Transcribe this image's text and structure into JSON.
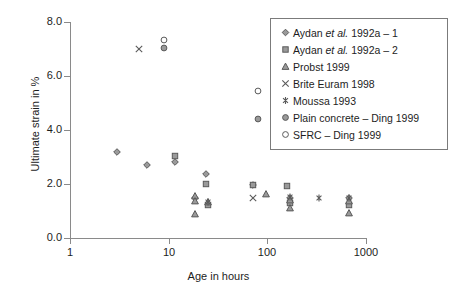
{
  "chart_data": {
    "type": "scatter",
    "title": "",
    "xlabel": "Age in hours",
    "ylabel": "Ultimate strain in %",
    "xscale": "log",
    "xlim": [
      1,
      1000
    ],
    "ylim": [
      0.0,
      8.0
    ],
    "xticks": [
      "1",
      "10",
      "100",
      "1000"
    ],
    "xtick_values": [
      1,
      10,
      100,
      1000
    ],
    "yticks": [
      "0.0",
      "2.0",
      "4.0",
      "6.0",
      "8.0"
    ],
    "ytick_values": [
      0.0,
      2.0,
      4.0,
      6.0,
      8.0
    ],
    "grid": false,
    "legend_position": "top-right",
    "series": [
      {
        "name": "Aydan et al. 1992a – 1",
        "name_pre": "Aydan ",
        "name_italic": "et al.",
        "name_post": " 1992a – 1",
        "marker": "diamond",
        "points": [
          {
            "x": 3.0,
            "y": 3.18
          },
          {
            "x": 6.0,
            "y": 2.72
          },
          {
            "x": 11.5,
            "y": 2.8
          },
          {
            "x": 24.0,
            "y": 2.36
          },
          {
            "x": 18.5,
            "y": 1.47
          },
          {
            "x": 72.0,
            "y": 1.95
          },
          {
            "x": 168.0,
            "y": 1.5
          },
          {
            "x": 672.0,
            "y": 1.5
          }
        ]
      },
      {
        "name": "Aydan et al. 1992a – 2",
        "name_pre": "Aydan ",
        "name_italic": "et al.",
        "name_post": " 1992a – 2",
        "marker": "square",
        "points": [
          {
            "x": 11.5,
            "y": 3.03
          },
          {
            "x": 24.0,
            "y": 2.0
          },
          {
            "x": 25.0,
            "y": 1.22
          },
          {
            "x": 72.0,
            "y": 1.98
          },
          {
            "x": 160.0,
            "y": 1.93
          },
          {
            "x": 168.0,
            "y": 1.28
          },
          {
            "x": 672.0,
            "y": 1.22
          }
        ]
      },
      {
        "name": "Probst 1999",
        "marker": "triangle",
        "points": [
          {
            "x": 18.5,
            "y": 1.57
          },
          {
            "x": 18.5,
            "y": 1.36
          },
          {
            "x": 18.5,
            "y": 0.9
          },
          {
            "x": 25.0,
            "y": 1.33
          },
          {
            "x": 96.0,
            "y": 1.62
          },
          {
            "x": 168.0,
            "y": 1.42
          },
          {
            "x": 168.0,
            "y": 1.1
          },
          {
            "x": 672.0,
            "y": 1.38
          },
          {
            "x": 672.0,
            "y": 0.92
          }
        ]
      },
      {
        "name": "Brite Euram 1998",
        "marker": "cross",
        "points": [
          {
            "x": 5.0,
            "y": 7.0
          },
          {
            "x": 72.0,
            "y": 1.5
          }
        ]
      },
      {
        "name": "Moussa 1993",
        "marker": "asterisk",
        "points": [
          {
            "x": 25.0,
            "y": 1.35
          },
          {
            "x": 168.0,
            "y": 1.52
          },
          {
            "x": 336.0,
            "y": 1.5
          },
          {
            "x": 672.0,
            "y": 1.5
          }
        ]
      },
      {
        "name": "Plain concrete – Ding 1999",
        "marker": "circle-dot",
        "points": [
          {
            "x": 9.0,
            "y": 7.03
          },
          {
            "x": 80.0,
            "y": 4.4
          }
        ]
      },
      {
        "name": "SFRC – Ding 1999",
        "marker": "circle-open",
        "points": [
          {
            "x": 9.0,
            "y": 7.32
          },
          {
            "x": 80.0,
            "y": 5.45
          }
        ]
      }
    ]
  },
  "axes": {
    "x_title": "Age in hours",
    "y_title": "Ultimate strain in %"
  },
  "legend": {
    "items": [
      {
        "marker": "diamond",
        "label": "Aydan et al. 1992a – 1"
      },
      {
        "marker": "square",
        "label": "Aydan et al. 1992a – 2"
      },
      {
        "marker": "triangle",
        "label": "Probst 1999"
      },
      {
        "marker": "cross",
        "label": "Brite Euram 1998"
      },
      {
        "marker": "asterisk",
        "label": "Moussa 1993"
      },
      {
        "marker": "circle-dot",
        "label": "Plain concrete – Ding 1999"
      },
      {
        "marker": "circle-open",
        "label": "SFRC – Ding 1999"
      }
    ]
  },
  "colors": {
    "marker": "#5a5a5a",
    "marker_fill": "#9a9a9a",
    "axis": "#8a8a8a",
    "text": "#1d1d1d",
    "legend_border": "#7b7b7b",
    "background": "#ffffff"
  }
}
